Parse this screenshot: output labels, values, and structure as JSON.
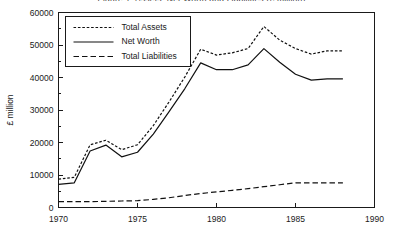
{
  "chart_data": {
    "type": "line",
    "title": "Figure 1: Assets, Net Worth and Liabilities (£ million)",
    "xlabel": "",
    "ylabel": "£ million",
    "xlim": [
      1970,
      1990
    ],
    "ylim": [
      0,
      60000
    ],
    "xticks": [
      1970,
      1975,
      1980,
      1985,
      1990
    ],
    "yticks": [
      0,
      10000,
      20000,
      30000,
      40000,
      50000,
      60000
    ],
    "xtick_labels": [
      "1970",
      "1975",
      "1980",
      "1985",
      "1990"
    ],
    "ytick_labels": [
      "0",
      "10000",
      "20000",
      "30000",
      "40000",
      "50000",
      "60000"
    ],
    "minor_yticks": [
      5000,
      15000,
      25000,
      35000,
      45000,
      55000
    ],
    "grid": false,
    "legend_position": "upper left",
    "x": [
      1970,
      1971,
      1972,
      1973,
      1974,
      1975,
      1976,
      1977,
      1978,
      1979,
      1980,
      1981,
      1982,
      1983,
      1984,
      1985,
      1986,
      1987,
      1988
    ],
    "series": [
      {
        "name": "Total Assets",
        "style": "dotted",
        "values": [
          8700,
          9300,
          19300,
          20700,
          17800,
          19300,
          25200,
          32500,
          40200,
          48700,
          46900,
          47600,
          48900,
          55700,
          51500,
          48900,
          47200,
          48200,
          48200
        ]
      },
      {
        "name": "Net Worth",
        "style": "solid",
        "values": [
          7100,
          7600,
          17400,
          19200,
          15600,
          17000,
          22600,
          29500,
          36600,
          44500,
          42400,
          42400,
          43900,
          48900,
          44700,
          41000,
          39200,
          39600,
          39600
        ]
      },
      {
        "name": "Total Liabilities",
        "style": "dashed",
        "values": [
          1800,
          1800,
          1800,
          1900,
          2000,
          2100,
          2500,
          3000,
          3700,
          4300,
          4800,
          5300,
          5800,
          6400,
          7000,
          7600,
          7600,
          7600,
          7600
        ]
      }
    ]
  },
  "legend": {
    "items": [
      {
        "label": "Total Assets"
      },
      {
        "label": "Net Worth"
      },
      {
        "label": "Total Liabilities"
      }
    ]
  },
  "colors": {
    "ink": "#111111",
    "axis": "#1a1a1a",
    "background": "#ffffff"
  }
}
